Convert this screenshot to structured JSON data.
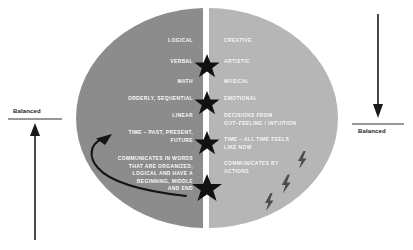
{
  "diagram": {
    "title_hidden": "",
    "colors": {
      "left_hemisphere": "#8c8c8c",
      "right_hemisphere": "#b6b6b6",
      "background": "#ffffff",
      "label_text": "#ffffff",
      "ink": "#1b1b1b",
      "star": "#111111"
    }
  },
  "left_panel": {
    "name": "left-hemisphere",
    "labels": [
      {
        "text": "LOGICAL",
        "x": 193,
        "y": 40
      },
      {
        "text": "VERBAL",
        "x": 193,
        "y": 61
      },
      {
        "text": "MATH",
        "x": 193,
        "y": 81
      },
      {
        "text": "ORDERLY, SEQUENTIAL",
        "x": 193,
        "y": 98
      },
      {
        "text": "LINEAR",
        "x": 193,
        "y": 115
      },
      {
        "text": "TIME – PAST, PRESENT,\nFUTURE",
        "x": 193,
        "y": 132
      },
      {
        "text": "COMMUNICATES IN WORDS\nTHAT ARE ORGANIZED,\nLOGICAL AND HAVE A\nBEGINNING, MIDDLE\nAND END",
        "x": 193,
        "y": 159
      }
    ]
  },
  "right_panel": {
    "name": "right-hemisphere",
    "labels": [
      {
        "text": "CREATIVE",
        "x": 224,
        "y": 40
      },
      {
        "text": "ARTISTIC",
        "x": 224,
        "y": 61
      },
      {
        "text": "MUSICAL",
        "x": 224,
        "y": 81
      },
      {
        "text": "EMOTIONAL",
        "x": 224,
        "y": 98
      },
      {
        "text": "DECISIONS FROM\nGUT–FEELING / INTUITION",
        "x": 224,
        "y": 115
      },
      {
        "text": "TIME – ALL TIME FEELS\nLIKE NOW",
        "x": 224,
        "y": 139
      },
      {
        "text": "COMMUNICATES BY\nACTIONS",
        "x": 224,
        "y": 163
      }
    ]
  },
  "gauges": {
    "left": {
      "label": "Balanced",
      "label_x": 13,
      "label_y": 110,
      "direction": "up"
    },
    "right": {
      "label": "Balanced",
      "label_x": 357,
      "label_y": 131,
      "direction": "down"
    }
  },
  "markers": {
    "stars": [
      {
        "cx": 207,
        "cy": 66,
        "r": 12
      },
      {
        "cx": 207,
        "cy": 103,
        "r": 12
      },
      {
        "cx": 207,
        "cy": 143,
        "r": 12
      },
      {
        "cx": 207,
        "cy": 188,
        "r": 14
      }
    ],
    "bolts": [
      {
        "cx": 302,
        "cy": 160,
        "s": 1.0
      },
      {
        "cx": 286,
        "cy": 184,
        "s": 1.05
      },
      {
        "cx": 269,
        "cy": 202,
        "s": 1.0
      }
    ]
  }
}
